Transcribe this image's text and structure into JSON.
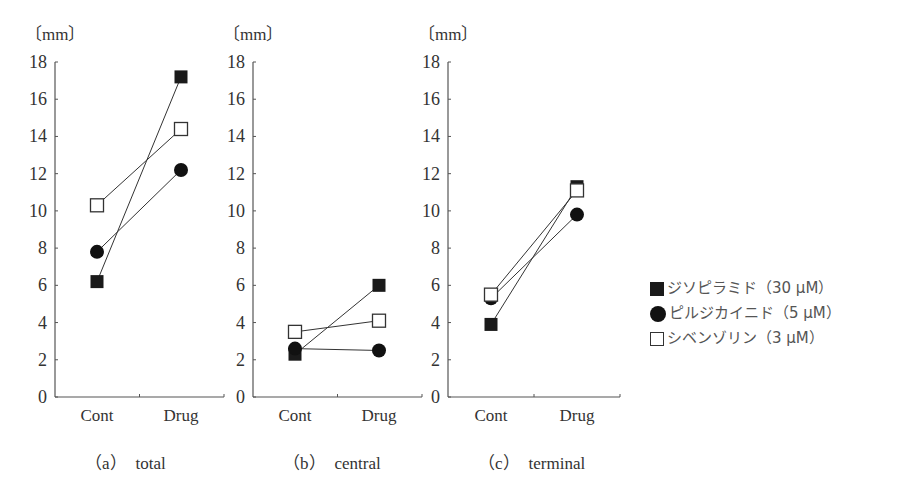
{
  "chart_data": [
    {
      "type": "line",
      "panel_label": "（a）　total",
      "unit_label": "〔mm〕",
      "categories": [
        "Cont",
        "Drug"
      ],
      "ylim": [
        0,
        18
      ],
      "yticks": [
        0,
        2,
        4,
        6,
        8,
        10,
        12,
        14,
        16,
        18
      ],
      "grid": false,
      "series": [
        {
          "name": "ジソピラミド（30 μM）",
          "marker": "filled-square",
          "values": [
            6.2,
            17.2
          ]
        },
        {
          "name": "ピルジカイニド（5 μM）",
          "marker": "filled-circle",
          "values": [
            7.8,
            12.2
          ]
        },
        {
          "name": "シベンゾリン（3 μM）",
          "marker": "open-square",
          "values": [
            10.3,
            14.4
          ]
        }
      ]
    },
    {
      "type": "line",
      "panel_label": "（b）　central",
      "unit_label": "〔mm〕",
      "categories": [
        "Cont",
        "Drug"
      ],
      "ylim": [
        0,
        18
      ],
      "yticks": [
        0,
        2,
        4,
        6,
        8,
        10,
        12,
        14,
        16,
        18
      ],
      "grid": false,
      "series": [
        {
          "name": "ジソピラミド（30 μM）",
          "marker": "filled-square",
          "values": [
            2.3,
            6.0
          ]
        },
        {
          "name": "ピルジカイニド（5 μM）",
          "marker": "filled-circle",
          "values": [
            2.6,
            2.5
          ]
        },
        {
          "name": "シベンゾリン（3 μM）",
          "marker": "open-square",
          "values": [
            3.5,
            4.1
          ]
        }
      ]
    },
    {
      "type": "line",
      "panel_label": "（c）　terminal",
      "unit_label": "〔mm〕",
      "categories": [
        "Cont",
        "Drug"
      ],
      "ylim": [
        0,
        18
      ],
      "yticks": [
        0,
        2,
        4,
        6,
        8,
        10,
        12,
        14,
        16,
        18
      ],
      "grid": false,
      "series": [
        {
          "name": "ジソピラミド（30 μM）",
          "marker": "filled-square",
          "values": [
            3.9,
            11.3
          ]
        },
        {
          "name": "ピルジカイニド（5 μM）",
          "marker": "filled-circle",
          "values": [
            5.3,
            9.8
          ]
        },
        {
          "name": "シベンゾリン（3 μM）",
          "marker": "open-square",
          "values": [
            5.5,
            11.1
          ]
        }
      ]
    }
  ],
  "legend": {
    "position": "right",
    "items": [
      {
        "marker": "filled-square",
        "label": "ジソピラミド（30 μM）"
      },
      {
        "marker": "filled-circle",
        "label": "ピルジカイニド（5 μM）"
      },
      {
        "marker": "open-square",
        "label": "シベンゾリン（3 μM）"
      }
    ]
  }
}
